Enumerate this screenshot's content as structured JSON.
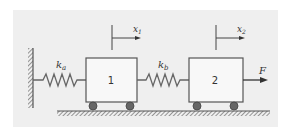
{
  "diagram": {
    "background_color": "#efefef",
    "line_color": "#555555",
    "spring_color": "#666666",
    "wheel_color": "#555555",
    "masses": [
      {
        "label": "1"
      },
      {
        "label": "2"
      }
    ],
    "springs": [
      {
        "symbol": "k",
        "subscript": "a"
      },
      {
        "symbol": "k",
        "subscript": "b"
      }
    ],
    "displacements": [
      {
        "symbol": "x",
        "subscript": "1"
      },
      {
        "symbol": "x",
        "subscript": "2"
      }
    ],
    "force": {
      "label": "F"
    }
  }
}
